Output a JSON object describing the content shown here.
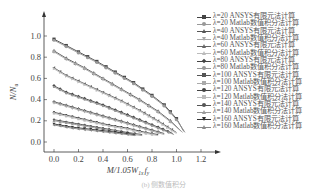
{
  "chart_data": {
    "type": "line",
    "title": "",
    "xlabel": "M/1.05W_{1x}f_y",
    "ylabel": "N/N_u",
    "xlim": [
      -0.05,
      1.3
    ],
    "ylim": [
      -0.05,
      1.1
    ],
    "xticks": [
      "0.0",
      "0.2",
      "0.4",
      "0.6",
      "0.8",
      "1.0",
      "1.2"
    ],
    "yticks": [
      "0.0",
      "0.2",
      "0.4",
      "0.6",
      "0.8",
      "1.0"
    ],
    "grid": false,
    "legend_position": "right",
    "series": [
      {
        "name": "λ=20 ANSYS有限元法计算",
        "color": "#444444",
        "marker": "square",
        "x": [
          0.0,
          0.1,
          0.2,
          0.35,
          0.5,
          0.65,
          0.8,
          0.9,
          1.0,
          1.06
        ],
        "y": [
          0.97,
          0.91,
          0.85,
          0.76,
          0.66,
          0.56,
          0.44,
          0.35,
          0.22,
          0.1
        ]
      },
      {
        "name": "λ=20 Matlab数值积分法计算",
        "color": "#999999",
        "marker": "circle",
        "x": [
          0.0,
          0.1,
          0.2,
          0.35,
          0.5,
          0.65,
          0.8,
          0.9,
          1.0,
          1.07
        ],
        "y": [
          0.96,
          0.9,
          0.84,
          0.75,
          0.65,
          0.55,
          0.43,
          0.34,
          0.21,
          0.09
        ]
      },
      {
        "name": "λ=40 ANSYS有限元法计算",
        "color": "#555555",
        "marker": "triangle-up",
        "x": [
          0.0,
          0.1,
          0.25,
          0.4,
          0.55,
          0.7,
          0.85,
          0.95,
          1.04
        ],
        "y": [
          0.86,
          0.79,
          0.7,
          0.6,
          0.5,
          0.4,
          0.29,
          0.2,
          0.1
        ]
      },
      {
        "name": "λ=40 Matlab数值积分法计算",
        "color": "#aaaaaa",
        "marker": "triangle-down",
        "x": [
          0.0,
          0.1,
          0.25,
          0.4,
          0.55,
          0.7,
          0.85,
          0.95,
          1.05
        ],
        "y": [
          0.85,
          0.78,
          0.69,
          0.59,
          0.49,
          0.39,
          0.28,
          0.19,
          0.09
        ]
      },
      {
        "name": "λ=60 ANSYS有限元法计算",
        "color": "#666666",
        "marker": "triangle-left",
        "x": [
          0.0,
          0.1,
          0.25,
          0.4,
          0.55,
          0.7,
          0.85,
          1.0
        ],
        "y": [
          0.7,
          0.63,
          0.55,
          0.47,
          0.39,
          0.3,
          0.2,
          0.09
        ]
      },
      {
        "name": "λ=60 Matlab数值积分法计算",
        "color": "#bbbbbb",
        "marker": "triangle-right",
        "x": [
          0.0,
          0.1,
          0.25,
          0.4,
          0.55,
          0.7,
          0.85,
          1.0
        ],
        "y": [
          0.69,
          0.62,
          0.54,
          0.46,
          0.38,
          0.29,
          0.19,
          0.08
        ]
      },
      {
        "name": "λ=80 ANSYS有限元法计算",
        "color": "#444444",
        "marker": "diamond",
        "x": [
          0.0,
          0.1,
          0.25,
          0.4,
          0.55,
          0.7,
          0.85,
          0.97
        ],
        "y": [
          0.53,
          0.47,
          0.41,
          0.35,
          0.28,
          0.21,
          0.14,
          0.08
        ]
      },
      {
        "name": "λ=80 Matlab数值积分法计算",
        "color": "#999999",
        "marker": "hexagon",
        "x": [
          0.0,
          0.1,
          0.25,
          0.4,
          0.55,
          0.7,
          0.85,
          0.98
        ],
        "y": [
          0.52,
          0.46,
          0.4,
          0.34,
          0.27,
          0.2,
          0.13,
          0.07
        ]
      },
      {
        "name": "λ=100 ANSYS有限元法计算",
        "color": "#555555",
        "marker": "star",
        "x": [
          0.0,
          0.15,
          0.3,
          0.45,
          0.6,
          0.75,
          0.9
        ],
        "y": [
          0.38,
          0.33,
          0.28,
          0.23,
          0.18,
          0.13,
          0.08
        ]
      },
      {
        "name": "λ=100 Matlab数值积分法计算",
        "color": "#aaaaaa",
        "marker": "plus",
        "x": [
          0.0,
          0.15,
          0.3,
          0.45,
          0.6,
          0.75,
          0.9
        ],
        "y": [
          0.37,
          0.32,
          0.27,
          0.22,
          0.17,
          0.12,
          0.07
        ]
      },
      {
        "name": "λ=120 ANSYS有限元法计算",
        "color": "#444444",
        "marker": "pentagon",
        "x": [
          0.0,
          0.15,
          0.3,
          0.45,
          0.6,
          0.75,
          0.85
        ],
        "y": [
          0.28,
          0.24,
          0.2,
          0.16,
          0.13,
          0.09,
          0.07
        ]
      },
      {
        "name": "λ=120 Matlab数值积分法计算",
        "color": "#bbbbbb",
        "marker": "square",
        "x": [
          0.0,
          0.15,
          0.3,
          0.45,
          0.6,
          0.75,
          0.85
        ],
        "y": [
          0.27,
          0.23,
          0.19,
          0.15,
          0.12,
          0.08,
          0.06
        ]
      },
      {
        "name": "λ=140 ANSYS有限元法计算",
        "color": "#555555",
        "marker": "circle",
        "x": [
          0.0,
          0.15,
          0.3,
          0.45,
          0.6,
          0.72
        ],
        "y": [
          0.21,
          0.18,
          0.15,
          0.12,
          0.09,
          0.07
        ]
      },
      {
        "name": "λ=140 Matlab数值积分法计算",
        "color": "#999999",
        "marker": "triangle-up",
        "x": [
          0.0,
          0.15,
          0.3,
          0.45,
          0.6,
          0.72
        ],
        "y": [
          0.2,
          0.17,
          0.14,
          0.11,
          0.08,
          0.06
        ]
      },
      {
        "name": "λ=160 ANSYS有限元法计算",
        "color": "#333333",
        "marker": "triangle-down",
        "x": [
          0.0,
          0.15,
          0.3,
          0.45,
          0.6,
          0.66
        ],
        "y": [
          0.17,
          0.14,
          0.12,
          0.1,
          0.08,
          0.07
        ]
      },
      {
        "name": "λ=160 Matlab数值积分法计算",
        "color": "#888888",
        "marker": "triangle-left",
        "x": [
          0.0,
          0.15,
          0.3,
          0.45,
          0.6,
          0.66
        ],
        "y": [
          0.16,
          0.13,
          0.11,
          0.09,
          0.07,
          0.06
        ]
      }
    ],
    "caption": "(b) 侧数值积分"
  },
  "axes": {
    "xlabel_main": "M/1.05W",
    "xlabel_sub": "1x",
    "xlabel_tail": "f",
    "xlabel_tail_sub": "y",
    "ylabel_main": "N/N",
    "ylabel_sub": "u"
  }
}
